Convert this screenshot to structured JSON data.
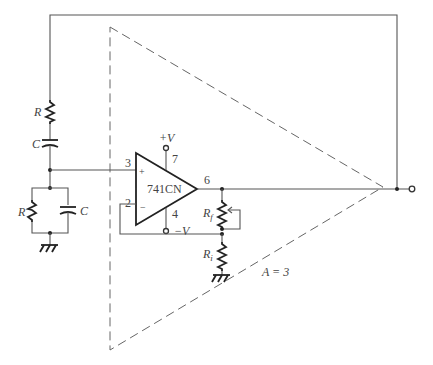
{
  "diagram": {
    "type": "circuit-schematic",
    "title": "",
    "amplifier": {
      "part_label": "741CN",
      "pins": {
        "noninverting": "3",
        "inverting": "2",
        "output": "6",
        "vplus": "7",
        "vminus": "4"
      },
      "input_signs": {
        "plus": "+",
        "minus": "−"
      },
      "supply_plus": "+V",
      "supply_minus": "−V"
    },
    "block": {
      "gain_label": "A = 3"
    },
    "components": {
      "series_r": "R",
      "series_c": "C",
      "shunt_r": "R",
      "shunt_c": "C",
      "feedback_r_main": "R",
      "feedback_r_main_sub": "f",
      "feedback_r_input": "R",
      "feedback_r_input_sub": "i"
    }
  }
}
